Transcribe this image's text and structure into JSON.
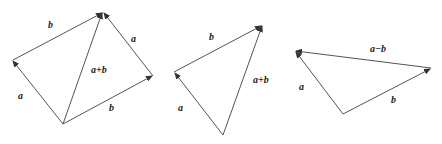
{
  "figures": [
    {
      "name": "parallelogram-rule",
      "labels": {
        "b_top": "b",
        "a_left": "a",
        "a_right": "a",
        "sum": "a+b",
        "b_bottom": "b"
      }
    },
    {
      "name": "triangle-rule-sum",
      "labels": {
        "b": "b",
        "a": "a",
        "sum": "a+b"
      }
    },
    {
      "name": "triangle-rule-difference",
      "labels": {
        "diff": "a−b",
        "a": "a",
        "b": "b"
      }
    }
  ],
  "colors": {
    "line": "#555555",
    "text": "#222222"
  }
}
